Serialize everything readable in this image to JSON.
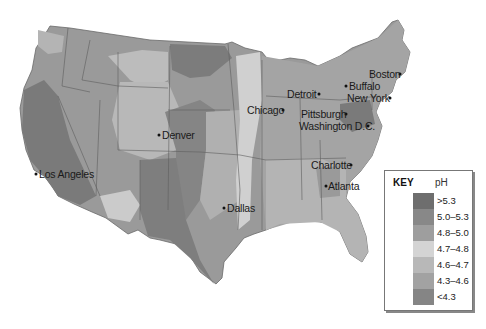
{
  "map": {
    "type": "choropleth",
    "region": "Contiguous United States",
    "variable": "pH"
  },
  "key": {
    "title": "KEY",
    "unit": "pH",
    "entries": [
      {
        "label": ">5.3",
        "color": "#6e6e6e"
      },
      {
        "label": "5.0–5.3",
        "color": "#888888"
      },
      {
        "label": "4.8–5.0",
        "color": "#9e9e9e"
      },
      {
        "label": "4.7–4.8",
        "color": "#d4d4d4"
      },
      {
        "label": "4.6–4.7",
        "color": "#b8b8b8"
      },
      {
        "label": "4.3–4.6",
        "color": "#a2a2a2"
      },
      {
        "label": "<4.3",
        "color": "#858585"
      }
    ]
  },
  "cities": [
    {
      "name": "Boston"
    },
    {
      "name": "Buffalo"
    },
    {
      "name": "New York"
    },
    {
      "name": "Detroit"
    },
    {
      "name": "Chicago"
    },
    {
      "name": "Pittsburgh"
    },
    {
      "name": "Washington D.C."
    },
    {
      "name": "Denver"
    },
    {
      "name": "Los Angeles"
    },
    {
      "name": "Charlotte"
    },
    {
      "name": "Atlanta"
    },
    {
      "name": "Dallas"
    }
  ]
}
